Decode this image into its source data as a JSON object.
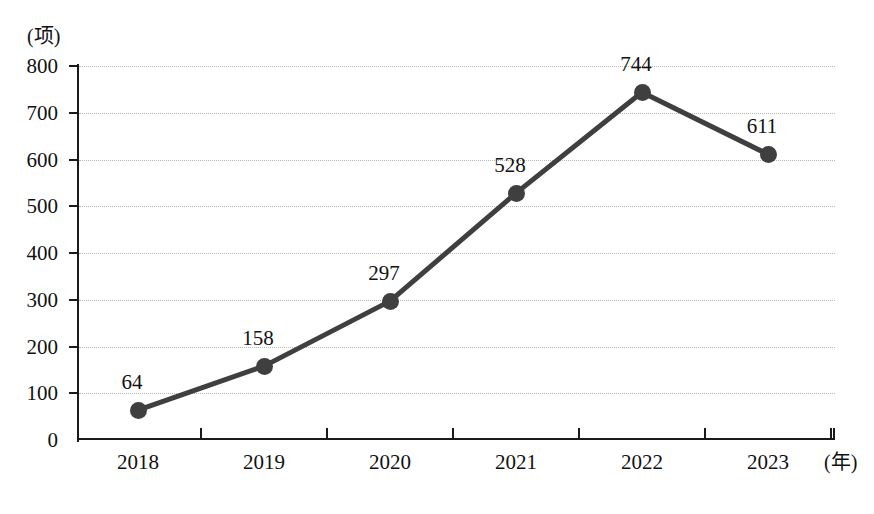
{
  "chart_data": {
    "type": "line",
    "title": "",
    "subtitle": "",
    "xlabel": "(年)",
    "ylabel": "(项)",
    "categories": [
      "2018",
      "2019",
      "2020",
      "2021",
      "2022",
      "2023"
    ],
    "values": [
      64,
      158,
      297,
      528,
      744,
      611
    ],
    "series": [
      {
        "name": "",
        "values": [
          64,
          158,
          297,
          528,
          744,
          611
        ]
      }
    ],
    "data_labels": [
      "64",
      "158",
      "297",
      "528",
      "744",
      "611"
    ],
    "ylim": [
      0,
      800
    ],
    "ytick_labels": [
      "0",
      "100",
      "200",
      "300",
      "400",
      "500",
      "600",
      "700",
      "800"
    ],
    "ytick_values": [
      0,
      100,
      200,
      300,
      400,
      500,
      600,
      700,
      800
    ],
    "xtick_labels": [
      "2018",
      "2019",
      "2020",
      "2021",
      "2022",
      "2023"
    ],
    "grid": true,
    "grid_axis": "y",
    "grid_style": "dotted",
    "legend": false,
    "legend_position": "none",
    "marker": "circle",
    "colors": {
      "line": "#3f3f3f",
      "marker": "#3f3f3f",
      "axis": "#1a1a1a",
      "grid": "#b9b9b9",
      "text": "#111111",
      "background": "#ffffff"
    }
  }
}
